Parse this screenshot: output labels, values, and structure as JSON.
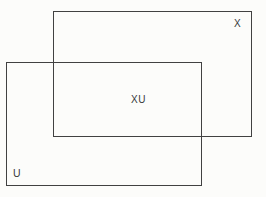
{
  "diagram": {
    "type": "set-overlap-diagram",
    "labels": {
      "set_x": "X",
      "set_u": "U",
      "intersection": "XU"
    },
    "colors": {
      "line": "#414141",
      "text": "#3a3a3a",
      "background": "#fcfcfa"
    }
  }
}
